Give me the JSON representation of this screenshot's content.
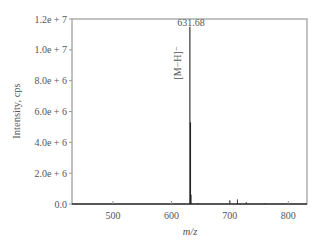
{
  "chart_data": {
    "type": "line",
    "subtype": "mass-spectrum-stick",
    "title": "",
    "xlabel": "m/z",
    "ylabel": "Intensity, cps",
    "xlim": [
      430,
      832
    ],
    "ylim": [
      0,
      12000000
    ],
    "xticks": [
      500,
      600,
      700,
      800
    ],
    "xtick_labels": [
      "500",
      "600",
      "700",
      "800"
    ],
    "yticks": [
      0,
      2000000,
      4000000,
      6000000,
      8000000,
      10000000,
      12000000
    ],
    "ytick_labels": [
      "0.0",
      "2.0e + 6",
      "4.0e + 6",
      "6.0e + 6",
      "8.0e + 6",
      "1.0e + 7",
      "1.2e + 7"
    ],
    "grid": false,
    "legend": null,
    "peaks": [
      {
        "mz": 631.68,
        "intensity": 11500000
      },
      {
        "mz": 632.7,
        "intensity": 5300000
      },
      {
        "mz": 633.7,
        "intensity": 600000
      },
      {
        "mz": 645,
        "intensity": 60000
      },
      {
        "mz": 700,
        "intensity": 250000
      },
      {
        "mz": 713,
        "intensity": 300000
      },
      {
        "mz": 728,
        "intensity": 120000
      },
      {
        "mz": 760,
        "intensity": 40000
      }
    ],
    "annotations": [
      {
        "text": "631.68",
        "mz": 631.68,
        "position": "top-of-peak"
      },
      {
        "text": "[M−H]⁻",
        "mz": 631.68,
        "position": "left-of-peak",
        "rotation": -90
      }
    ]
  },
  "labels": {
    "peak_value": "631.68",
    "ion_label": "[M−H]⁻",
    "xlabel": "m/z",
    "ylabel": "Intensity, cps"
  }
}
